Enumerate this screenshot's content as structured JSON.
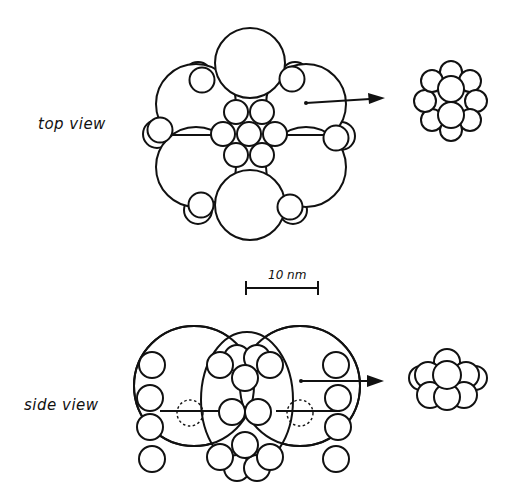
{
  "labels": {
    "top_view": "top view",
    "side_view": "side view",
    "scale_bar": "10 nm"
  },
  "figure": {
    "panels": [
      {
        "name": "top view",
        "elements": [
          "6 large outer subunits",
          "7 small central subunits",
          "6 small peripheral subunits",
          "arrow to isolated 7-member cluster"
        ]
      },
      {
        "name": "side view",
        "elements": [
          "large subunit outlines",
          "small stacked subunits",
          "dashed hidden subunits",
          "arrow to isolated cluster"
        ]
      }
    ],
    "scale": {
      "value": 10,
      "unit": "nm"
    },
    "colors": {
      "stroke": "#111111",
      "background": "#ffffff"
    }
  }
}
